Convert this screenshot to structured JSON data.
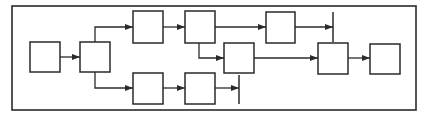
{
  "diagram": {
    "type": "flow-block-diagram",
    "colors": {
      "stroke": "#2a2a2a",
      "fill": "#ffffff",
      "background": "#ffffff"
    },
    "frame": {
      "x": 12,
      "y": 6,
      "w": 404,
      "h": 104
    },
    "boxes": [
      {
        "id": "A",
        "x": 30,
        "y": 42,
        "w": 30,
        "h": 30
      },
      {
        "id": "B",
        "x": 80,
        "y": 42,
        "w": 30,
        "h": 30
      },
      {
        "id": "C",
        "x": 133,
        "y": 11,
        "w": 30,
        "h": 32
      },
      {
        "id": "D",
        "x": 133,
        "y": 73,
        "w": 30,
        "h": 31
      },
      {
        "id": "E",
        "x": 185,
        "y": 11,
        "w": 30,
        "h": 32
      },
      {
        "id": "F",
        "x": 185,
        "y": 73,
        "w": 30,
        "h": 31
      },
      {
        "id": "G",
        "x": 266,
        "y": 12,
        "w": 29,
        "h": 31
      },
      {
        "id": "H",
        "x": 224,
        "y": 43,
        "w": 30,
        "h": 30
      },
      {
        "id": "I",
        "x": 318,
        "y": 43,
        "w": 30,
        "h": 31
      },
      {
        "id": "J",
        "x": 370,
        "y": 44,
        "w": 30,
        "h": 30
      }
    ],
    "bars": [
      {
        "id": "bar-top",
        "x": 333,
        "y1": 12,
        "y2": 42
      },
      {
        "id": "bar-bottom",
        "x": 239,
        "y1": 75,
        "y2": 104
      }
    ],
    "connectors": [
      {
        "from": "A",
        "to": "B",
        "points": [
          [
            60,
            57
          ],
          [
            80,
            57
          ]
        ]
      },
      {
        "from": "B",
        "to": "C",
        "points": [
          [
            95,
            42
          ],
          [
            95,
            27
          ],
          [
            133,
            27
          ]
        ]
      },
      {
        "from": "B",
        "to": "D",
        "points": [
          [
            95,
            72
          ],
          [
            95,
            88
          ],
          [
            133,
            88
          ]
        ]
      },
      {
        "from": "C",
        "to": "E",
        "points": [
          [
            163,
            27
          ],
          [
            185,
            27
          ]
        ]
      },
      {
        "from": "D",
        "to": "F",
        "points": [
          [
            163,
            88
          ],
          [
            185,
            88
          ]
        ]
      },
      {
        "from": "E",
        "to": "G",
        "points": [
          [
            215,
            27
          ],
          [
            266,
            27
          ]
        ]
      },
      {
        "from": "E",
        "to": "H",
        "points": [
          [
            199,
            43
          ],
          [
            199,
            58
          ],
          [
            224,
            58
          ]
        ]
      },
      {
        "from": "G",
        "to": "bar-top",
        "points": [
          [
            295,
            27
          ],
          [
            333,
            27
          ]
        ]
      },
      {
        "from": "F",
        "to": "bar-bottom",
        "points": [
          [
            215,
            88
          ],
          [
            239,
            88
          ]
        ]
      },
      {
        "from": "H",
        "to": "I",
        "points": [
          [
            254,
            58
          ],
          [
            318,
            58
          ]
        ]
      },
      {
        "from": "I",
        "to": "J",
        "points": [
          [
            348,
            58
          ],
          [
            370,
            58
          ]
        ]
      }
    ]
  }
}
